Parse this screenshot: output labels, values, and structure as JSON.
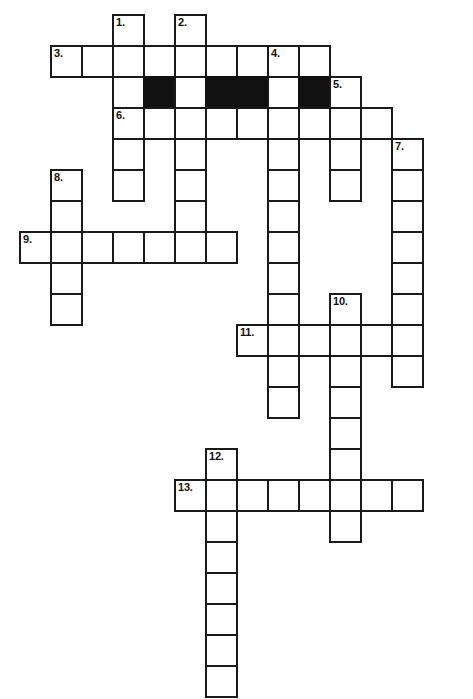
{
  "puzzle": {
    "title": "Crossword Puzzle Grid",
    "width_px": 473,
    "height_px": 699,
    "cell_size_px": 31,
    "origin_x_px": 19,
    "origin_y_px": 14,
    "colors": {
      "background": "#ffffff",
      "cell_fill": "#ffffff",
      "cell_border": "#1a1a1a",
      "blocked_fill": "#111111",
      "number_text": "#111111"
    },
    "numbers": {
      "n1": "1.",
      "n2": "2.",
      "n3": "3.",
      "n4": "4.",
      "n5": "5.",
      "n6": "6.",
      "n7": "7.",
      "n8": "8.",
      "n9": "9.",
      "n10": "10.",
      "n11": "11.",
      "n12": "12.",
      "n13": "13."
    },
    "cells": [
      {
        "c": 3,
        "r": 0,
        "num": "1.",
        "black": false
      },
      {
        "c": 5,
        "r": 0,
        "num": "2.",
        "black": false
      },
      {
        "c": 1,
        "r": 1,
        "num": "3.",
        "black": false
      },
      {
        "c": 2,
        "r": 1,
        "num": "",
        "black": false
      },
      {
        "c": 3,
        "r": 1,
        "num": "",
        "black": false
      },
      {
        "c": 4,
        "r": 1,
        "num": "",
        "black": false
      },
      {
        "c": 5,
        "r": 1,
        "num": "",
        "black": false
      },
      {
        "c": 6,
        "r": 1,
        "num": "",
        "black": false
      },
      {
        "c": 7,
        "r": 1,
        "num": "",
        "black": false
      },
      {
        "c": 8,
        "r": 1,
        "num": "4.",
        "black": false
      },
      {
        "c": 9,
        "r": 1,
        "num": "",
        "black": false
      },
      {
        "c": 3,
        "r": 2,
        "num": "",
        "black": false
      },
      {
        "c": 4,
        "r": 2,
        "num": "",
        "black": true
      },
      {
        "c": 5,
        "r": 2,
        "num": "",
        "black": false
      },
      {
        "c": 6,
        "r": 2,
        "num": "",
        "black": true
      },
      {
        "c": 7,
        "r": 2,
        "num": "",
        "black": true
      },
      {
        "c": 8,
        "r": 2,
        "num": "",
        "black": false
      },
      {
        "c": 9,
        "r": 2,
        "num": "",
        "black": true
      },
      {
        "c": 10,
        "r": 2,
        "num": "5.",
        "black": false
      },
      {
        "c": 3,
        "r": 3,
        "num": "6.",
        "black": false
      },
      {
        "c": 4,
        "r": 3,
        "num": "",
        "black": false
      },
      {
        "c": 5,
        "r": 3,
        "num": "",
        "black": false
      },
      {
        "c": 6,
        "r": 3,
        "num": "",
        "black": false
      },
      {
        "c": 7,
        "r": 3,
        "num": "",
        "black": false
      },
      {
        "c": 8,
        "r": 3,
        "num": "",
        "black": false
      },
      {
        "c": 9,
        "r": 3,
        "num": "",
        "black": false
      },
      {
        "c": 10,
        "r": 3,
        "num": "",
        "black": false
      },
      {
        "c": 11,
        "r": 3,
        "num": "",
        "black": false
      },
      {
        "c": 3,
        "r": 4,
        "num": "",
        "black": false
      },
      {
        "c": 5,
        "r": 4,
        "num": "",
        "black": false
      },
      {
        "c": 8,
        "r": 4,
        "num": "",
        "black": false
      },
      {
        "c": 10,
        "r": 4,
        "num": "",
        "black": false
      },
      {
        "c": 12,
        "r": 4,
        "num": "7.",
        "black": false
      },
      {
        "c": 1,
        "r": 5,
        "num": "8.",
        "black": false
      },
      {
        "c": 3,
        "r": 5,
        "num": "",
        "black": false
      },
      {
        "c": 5,
        "r": 5,
        "num": "",
        "black": false
      },
      {
        "c": 8,
        "r": 5,
        "num": "",
        "black": false
      },
      {
        "c": 10,
        "r": 5,
        "num": "",
        "black": false
      },
      {
        "c": 12,
        "r": 5,
        "num": "",
        "black": false
      },
      {
        "c": 1,
        "r": 6,
        "num": "",
        "black": false
      },
      {
        "c": 5,
        "r": 6,
        "num": "",
        "black": false
      },
      {
        "c": 8,
        "r": 6,
        "num": "",
        "black": false
      },
      {
        "c": 12,
        "r": 6,
        "num": "",
        "black": false
      },
      {
        "c": 0,
        "r": 7,
        "num": "9.",
        "black": false
      },
      {
        "c": 1,
        "r": 7,
        "num": "",
        "black": false
      },
      {
        "c": 2,
        "r": 7,
        "num": "",
        "black": false
      },
      {
        "c": 3,
        "r": 7,
        "num": "",
        "black": false
      },
      {
        "c": 4,
        "r": 7,
        "num": "",
        "black": false
      },
      {
        "c": 5,
        "r": 7,
        "num": "",
        "black": false
      },
      {
        "c": 6,
        "r": 7,
        "num": "",
        "black": false
      },
      {
        "c": 8,
        "r": 7,
        "num": "",
        "black": false
      },
      {
        "c": 12,
        "r": 7,
        "num": "",
        "black": false
      },
      {
        "c": 1,
        "r": 8,
        "num": "",
        "black": false
      },
      {
        "c": 8,
        "r": 8,
        "num": "",
        "black": false
      },
      {
        "c": 12,
        "r": 8,
        "num": "",
        "black": false
      },
      {
        "c": 1,
        "r": 9,
        "num": "",
        "black": false
      },
      {
        "c": 8,
        "r": 9,
        "num": "",
        "black": false
      },
      {
        "c": 10,
        "r": 9,
        "num": "10.",
        "black": false
      },
      {
        "c": 12,
        "r": 9,
        "num": "",
        "black": false
      },
      {
        "c": 7,
        "r": 10,
        "num": "11.",
        "black": false
      },
      {
        "c": 8,
        "r": 10,
        "num": "",
        "black": false
      },
      {
        "c": 9,
        "r": 10,
        "num": "",
        "black": false
      },
      {
        "c": 10,
        "r": 10,
        "num": "",
        "black": false
      },
      {
        "c": 11,
        "r": 10,
        "num": "",
        "black": false
      },
      {
        "c": 12,
        "r": 10,
        "num": "",
        "black": false
      },
      {
        "c": 8,
        "r": 11,
        "num": "",
        "black": false
      },
      {
        "c": 10,
        "r": 11,
        "num": "",
        "black": false
      },
      {
        "c": 12,
        "r": 11,
        "num": "",
        "black": false
      },
      {
        "c": 8,
        "r": 12,
        "num": "",
        "black": false
      },
      {
        "c": 10,
        "r": 12,
        "num": "",
        "black": false
      },
      {
        "c": 10,
        "r": 13,
        "num": "",
        "black": false
      },
      {
        "c": 6,
        "r": 14,
        "num": "12.",
        "black": false
      },
      {
        "c": 10,
        "r": 14,
        "num": "",
        "black": false
      },
      {
        "c": 5,
        "r": 15,
        "num": "13.",
        "black": false
      },
      {
        "c": 6,
        "r": 15,
        "num": "",
        "black": false
      },
      {
        "c": 7,
        "r": 15,
        "num": "",
        "black": false
      },
      {
        "c": 8,
        "r": 15,
        "num": "",
        "black": false
      },
      {
        "c": 9,
        "r": 15,
        "num": "",
        "black": false
      },
      {
        "c": 10,
        "r": 15,
        "num": "",
        "black": false
      },
      {
        "c": 11,
        "r": 15,
        "num": "",
        "black": false
      },
      {
        "c": 12,
        "r": 15,
        "num": "",
        "black": false
      },
      {
        "c": 6,
        "r": 16,
        "num": "",
        "black": false
      },
      {
        "c": 10,
        "r": 16,
        "num": "",
        "black": false
      },
      {
        "c": 6,
        "r": 17,
        "num": "",
        "black": false
      },
      {
        "c": 6,
        "r": 18,
        "num": "",
        "black": false
      },
      {
        "c": 6,
        "r": 19,
        "num": "",
        "black": false
      },
      {
        "c": 6,
        "r": 20,
        "num": "",
        "black": false
      },
      {
        "c": 6,
        "r": 21,
        "num": "",
        "black": false
      }
    ]
  }
}
